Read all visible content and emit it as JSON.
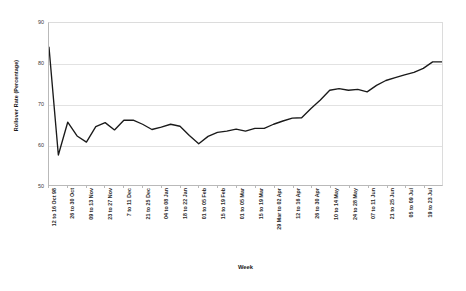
{
  "chart_data": {
    "type": "line",
    "title": "",
    "xlabel": "Week",
    "ylabel": "Rollover Rate (Percentage)",
    "ylim": [
      50,
      90
    ],
    "ytick_labels": [
      "90",
      "80",
      "70",
      "60",
      "50"
    ],
    "ytick_values": [
      90,
      80,
      70,
      60,
      50
    ],
    "grid": true,
    "legend": false,
    "line_color": "#1a1a1a",
    "xtick_labels": [
      "12 to 16 Oct 98",
      "26 to 30 Oct",
      "09 to 13 Nov",
      "23 to 27 Nov",
      "7 to 11 Dec",
      "21 to 25 Dec",
      "04 to 08 Jan",
      "18 to 22 Jan",
      "01 to 05 Feb",
      "15 to 19 Feb",
      "01 to 05 Mar",
      "15 to 19 Mar",
      "29 Mar to 02 Apr",
      "12 to 16 Apr",
      "26 to 30 Apr",
      "10 to 14 May",
      "24 to 28 May",
      "07 to 11 Jun",
      "21 to 25 Jun",
      "05 to 09 Jul",
      "19 to 23 Jul"
    ],
    "x_indices_of_ticks": [
      0,
      2,
      4,
      6,
      8,
      10,
      12,
      14,
      16,
      18,
      20,
      22,
      24,
      26,
      28,
      30,
      32,
      34,
      36,
      38,
      40
    ],
    "series": [
      {
        "name": "Rollover Rate",
        "values": [
          84.0,
          57.4,
          65.5,
          62.1,
          60.6,
          64.4,
          65.4,
          63.6,
          66.0,
          66.0,
          65.0,
          63.7,
          64.3,
          65.0,
          64.5,
          62.2,
          60.2,
          62.0,
          63.0,
          63.3,
          63.8,
          63.3,
          64.0,
          64.0,
          65.0,
          65.8,
          66.5,
          66.6,
          68.9,
          71.0,
          73.4,
          73.8,
          73.4,
          73.6,
          73.0,
          74.6,
          75.8,
          76.5,
          77.2,
          77.8,
          78.8,
          80.4,
          80.4
        ]
      }
    ]
  }
}
